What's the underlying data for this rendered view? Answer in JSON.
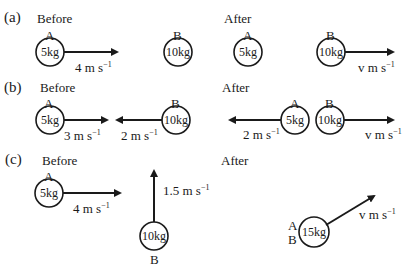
{
  "top_cut_text": "Solution",
  "parts": [
    {
      "label": "(a)",
      "before": {
        "heading": "Before",
        "A": {
          "name": "A",
          "mass": "5kg",
          "velocity": "4 m s",
          "velocity_exp": "−1",
          "direction": "right"
        },
        "B": {
          "name": "B",
          "mass": "10kg",
          "velocity": null
        }
      },
      "after": {
        "heading": "After",
        "A": {
          "name": "A",
          "mass": "5kg",
          "velocity": null
        },
        "B": {
          "name": "B",
          "mass": "10kg",
          "velocity": "v m s",
          "velocity_exp": "−1",
          "direction": "right"
        }
      }
    },
    {
      "label": "(b)",
      "before": {
        "heading": "Before",
        "A": {
          "name": "A",
          "mass": "5kg",
          "velocity": "3 m s",
          "velocity_exp": "−1",
          "direction": "right"
        },
        "B": {
          "name": "B",
          "mass": "10kg",
          "velocity": "2 m s",
          "velocity_exp": "−1",
          "direction": "left"
        }
      },
      "after": {
        "heading": "After",
        "A": {
          "name": "A",
          "mass": "5kg",
          "velocity": "2 m s",
          "velocity_exp": "−1",
          "direction": "left"
        },
        "B": {
          "name": "B",
          "mass": "10kg",
          "velocity": "v m s",
          "velocity_exp": "−1",
          "direction": "right"
        }
      }
    },
    {
      "label": "(c)",
      "before": {
        "heading": "Before",
        "A": {
          "name": "A",
          "mass": "5kg",
          "velocity": "4 m s",
          "velocity_exp": "−1",
          "direction": "right"
        },
        "B": {
          "name": "B",
          "mass": "10kg",
          "velocity": "1.5 m s",
          "velocity_exp": "−1",
          "direction": "up"
        }
      },
      "after": {
        "heading": "After",
        "combined": {
          "name_top": "A",
          "name_bottom": "B",
          "mass": "15kg",
          "velocity": "v m s",
          "velocity_exp": "−1",
          "direction": "up-right"
        }
      }
    }
  ],
  "colors": {
    "ink": "#1a1a1a",
    "background": "#ffffff"
  }
}
